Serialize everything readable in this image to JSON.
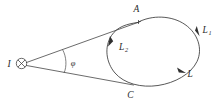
{
  "figure": {
    "type": "physics-diagram",
    "background_color": "#ffffff",
    "stroke_color": "#3a3a3a",
    "label_color": "#2b2b2b",
    "current": {
      "label": "I",
      "symbol_name": "current-into-page",
      "symbol_glyph": "⊗"
    },
    "angle": {
      "label": "φ",
      "name": "phi"
    },
    "points": [
      {
        "id": "A",
        "label": "A"
      },
      {
        "id": "C",
        "label": "C"
      }
    ],
    "curves": [
      {
        "id": "L1",
        "label": "L",
        "subscript": "1",
        "direction": "clockwise-down-right"
      },
      {
        "id": "L2",
        "label": "L",
        "subscript": "2",
        "direction": "counterclockwise-up-left"
      },
      {
        "id": "L",
        "label": "L",
        "subscript": "",
        "direction": "clockwise-down-right"
      }
    ]
  }
}
